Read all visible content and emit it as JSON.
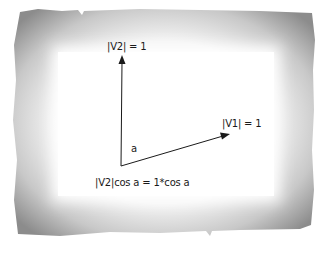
{
  "diagram": {
    "type": "vector-projection",
    "frame_style": "torn-paper-border",
    "labels": {
      "v2_magnitude": "|V2| = 1",
      "v1_magnitude": "|V1| = 1",
      "angle": "a",
      "projection": "|V2|cos a = 1*cos a"
    },
    "vectors": [
      {
        "name": "V2",
        "from": [
          121,
          166
        ],
        "to": [
          122,
          56
        ],
        "magnitude": 1
      },
      {
        "name": "V1",
        "from": [
          121,
          166
        ],
        "to": [
          229,
          134
        ],
        "magnitude": 1
      }
    ],
    "colors": {
      "ink": "#1a1a1a",
      "frame_dark": "#8a8a8a",
      "frame_light": "#e8e8e8",
      "paper": "#ffffff"
    }
  }
}
